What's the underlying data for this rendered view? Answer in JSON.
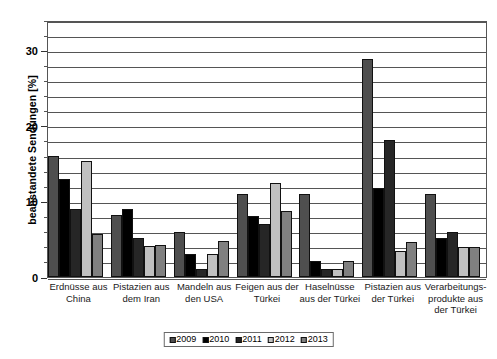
{
  "chart_data": {
    "type": "bar",
    "title": "",
    "xlabel": "",
    "ylabel": "beanstandete Sendungen [%]",
    "ylim": [
      0,
      34
    ],
    "ytick_labels": [
      "0",
      "10",
      "20",
      "30"
    ],
    "ytick_values": [
      0,
      10,
      20,
      30
    ],
    "grid": true,
    "grid_step": 2,
    "legend_position": "bottom-center",
    "categories": [
      "Erdnüsse aus China",
      "Pistazien aus dem Iran",
      "Mandeln aus den USA",
      "Feigen aus der Türkei",
      "Haselnüsse aus der Türkei",
      "Pistazien aus der Türkei",
      "Verarbeitungsprodukte aus der Türkei"
    ],
    "category_lines": [
      [
        "Erdnüsse aus",
        "China"
      ],
      [
        "Pistazien aus",
        "dem Iran"
      ],
      [
        "Mandeln aus",
        "den USA"
      ],
      [
        "Feigen aus der",
        "Türkei"
      ],
      [
        "Haselnüsse",
        "aus der Türkei"
      ],
      [
        "Pistazien aus",
        "der Türkei"
      ],
      [
        "Verarbeitungs-",
        "produkte aus",
        "der Türkei"
      ]
    ],
    "series": [
      {
        "name": "2009",
        "color": "#4f4f4f",
        "values": [
          16.0,
          8.2,
          6.0,
          11.0,
          11.0,
          28.9,
          11.0
        ]
      },
      {
        "name": "2010",
        "color": "#000000",
        "values": [
          13.0,
          9.0,
          3.1,
          8.1,
          2.1,
          11.8,
          5.2
        ]
      },
      {
        "name": "2011",
        "color": "#262626",
        "values": [
          9.0,
          5.2,
          1.1,
          7.0,
          1.1,
          18.1,
          6.0
        ]
      },
      {
        "name": "2012",
        "color": "#c0c0c0",
        "values": [
          15.3,
          4.1,
          3.1,
          12.4,
          1.1,
          3.5,
          4.0
        ]
      },
      {
        "name": "2013",
        "color": "#808080",
        "values": [
          5.7,
          4.2,
          4.8,
          8.7,
          2.1,
          4.6,
          4.0
        ]
      }
    ]
  },
  "legend": {
    "entries": [
      "2009",
      "2010",
      "2011",
      "2012",
      "2013"
    ]
  },
  "colors": {
    "axis": "#555555",
    "grid": "#555555",
    "bar_outline": "#111111",
    "background": "#ffffff"
  }
}
